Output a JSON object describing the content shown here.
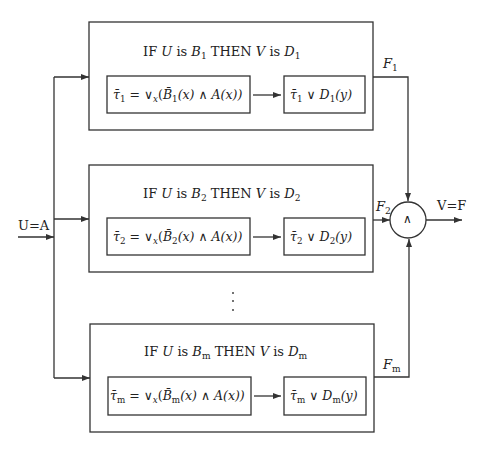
{
  "diagram": {
    "input_label": "U=A",
    "output_label": "V=F",
    "combiner_symbol": "∧",
    "ellipsis": "⋮",
    "rules": [
      {
        "index": "1",
        "rule_text": "IF U is B1 THEN V is D1",
        "rule_parts": {
          "pre": "IF ",
          "u": "U",
          "is1": " is ",
          "b": "B",
          "bsub": "1",
          "then": " THEN ",
          "v": "V",
          "is2": " is ",
          "d": "D",
          "dsub": "1"
        },
        "formula_left": "τ̄1 = ∨x(B̄1(x) ∧ A(x))",
        "formula_left_parts": {
          "tau": "τ̄",
          "tsub": "1",
          "eq": " = ∨",
          "xsub": "x",
          "open": "(",
          "bbar": "B̄",
          "bsub": "1",
          "mid": "(x) ∧ A(x))"
        },
        "formula_right": "τ̄1 ∨ D1(y)",
        "formula_right_parts": {
          "tau": "τ̄",
          "tsub": "1",
          "or": " ∨ ",
          "d": "D",
          "dsub": "1",
          "tail": "(y)"
        },
        "output_label": "F1",
        "output_parts": {
          "f": "F",
          "fsub": "1"
        }
      },
      {
        "index": "2",
        "rule_text": "IF U is B2 THEN V is D2",
        "rule_parts": {
          "pre": "IF ",
          "u": "U",
          "is1": " is ",
          "b": "B",
          "bsub": "2",
          "then": " THEN ",
          "v": "V",
          "is2": " is ",
          "d": "D",
          "dsub": "2"
        },
        "formula_left": "τ̄2 = ∨x(B̄2(x) ∧ A(x))",
        "formula_left_parts": {
          "tau": "τ̄",
          "tsub": "2",
          "eq": " = ∨",
          "xsub": "x",
          "open": "(",
          "bbar": "B̄",
          "bsub": "2",
          "mid": "(x) ∧ A(x))"
        },
        "formula_right": "τ̄2 ∨ D2(y)",
        "formula_right_parts": {
          "tau": "τ̄",
          "tsub": "2",
          "or": " ∨ ",
          "d": "D",
          "dsub": "2",
          "tail": "(y)"
        },
        "output_label": "F2",
        "output_parts": {
          "f": "F",
          "fsub": "2"
        }
      },
      {
        "index": "m",
        "rule_text": "IF U is Bm THEN V is Dm",
        "rule_parts": {
          "pre": "IF ",
          "u": "U",
          "is1": " is ",
          "b": "B",
          "bsub": "m",
          "then": " THEN ",
          "v": "V",
          "is2": " is ",
          "d": "D",
          "dsub": "m"
        },
        "formula_left": "τ̄m = ∨x(B̄m(x) ∧ A(x))",
        "formula_left_parts": {
          "tau": "τ̄",
          "tsub": "m",
          "eq": " = ∨",
          "xsub": "x",
          "open": "(",
          "bbar": "B̄",
          "bsub": "m",
          "mid": "(x) ∧ A(x))"
        },
        "formula_right": "τ̄m ∨ Dm(y)",
        "formula_right_parts": {
          "tau": "τ̄",
          "tsub": "m",
          "or": " ∨ ",
          "d": "D",
          "dsub": "m",
          "tail": "(y)"
        },
        "output_label": "Fm",
        "output_parts": {
          "f": "F",
          "fsub": "m"
        }
      }
    ],
    "colors": {
      "line": "#333333",
      "background": "#ffffff"
    }
  }
}
